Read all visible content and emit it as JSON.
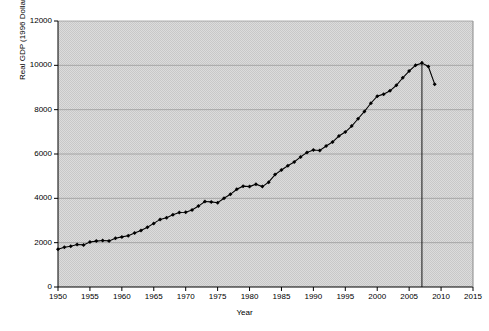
{
  "chart_data": {
    "type": "line",
    "title": "",
    "xlabel": "Year",
    "ylabel": "Real GDP (1996 Dollars)",
    "xlim": [
      1950,
      2015
    ],
    "ylim": [
      0,
      12000
    ],
    "xticks": [
      1950,
      1955,
      1960,
      1965,
      1970,
      1975,
      1980,
      1985,
      1990,
      1995,
      2000,
      2005,
      2010,
      2015
    ],
    "yticks": [
      0,
      2000,
      4000,
      6000,
      8000,
      10000,
      12000
    ],
    "grid": true,
    "legend": false,
    "marker": "diamond",
    "annotations": [
      {
        "type": "vertical-line",
        "x": 2007,
        "label": ""
      }
    ],
    "series": [
      {
        "name": "Real GDP (1996 Dollars)",
        "x": [
          1950,
          1951,
          1952,
          1953,
          1954,
          1955,
          1956,
          1957,
          1958,
          1959,
          1960,
          1961,
          1962,
          1963,
          1964,
          1965,
          1966,
          1967,
          1968,
          1969,
          1970,
          1971,
          1972,
          1973,
          1974,
          1975,
          1976,
          1977,
          1978,
          1979,
          1980,
          1981,
          1982,
          1983,
          1984,
          1985,
          1986,
          1987,
          1988,
          1989,
          1990,
          1991,
          1992,
          1993,
          1994,
          1995,
          1996,
          1997,
          1998,
          1999,
          2000,
          2001,
          2002,
          2003,
          2004,
          2005,
          2006,
          2007,
          2008,
          2009
        ],
        "values": [
          1700,
          1790,
          1840,
          1920,
          1900,
          2030,
          2070,
          2100,
          2080,
          2200,
          2260,
          2310,
          2440,
          2550,
          2700,
          2870,
          3050,
          3120,
          3260,
          3360,
          3370,
          3470,
          3650,
          3860,
          3840,
          3800,
          4000,
          4180,
          4410,
          4550,
          4530,
          4640,
          4530,
          4730,
          5070,
          5280,
          5470,
          5640,
          5870,
          6070,
          6180,
          6160,
          6360,
          6540,
          6810,
          6990,
          7260,
          7590,
          7920,
          8290,
          8610,
          8700,
          8850,
          9100,
          9440,
          9740,
          10000,
          10100,
          9950,
          9150
        ]
      }
    ]
  },
  "colors": {
    "plot_background": "#d4d4d4",
    "line": "#000000",
    "grid": "#9a9a9a",
    "axis": "#000000",
    "annotation_line": "#000000"
  }
}
